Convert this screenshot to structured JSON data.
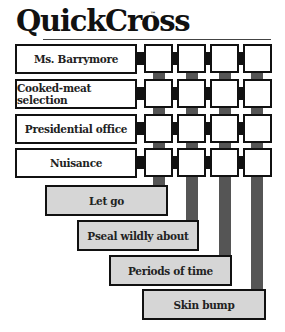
{
  "header": {
    "title": "QuickCross",
    "trademark": "™"
  },
  "grid": {
    "rows": 4,
    "cols": 4,
    "cells": [
      [
        "",
        "",
        "",
        ""
      ],
      [
        "",
        "",
        "",
        ""
      ],
      [
        "",
        "",
        "",
        ""
      ],
      [
        "",
        "",
        "",
        ""
      ]
    ]
  },
  "across_clues": [
    {
      "label": "Ms. Barrymore"
    },
    {
      "label": "Cooked-meat selection"
    },
    {
      "label": "Presidential office"
    },
    {
      "label": "Nuisance"
    }
  ],
  "down_clues": [
    {
      "label": "Let go"
    },
    {
      "label": "Pseal wildly about"
    },
    {
      "label": "Periods of time"
    },
    {
      "label": "Skin bump"
    }
  ],
  "colors": {
    "across_bg": "#ffffff",
    "down_bg": "#d6d6d6",
    "connector": "#555555",
    "border": "#111111"
  }
}
